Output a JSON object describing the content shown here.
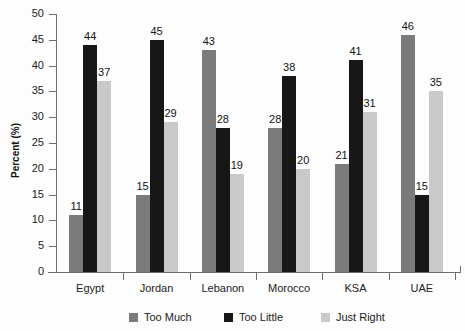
{
  "chart_data": {
    "type": "bar",
    "title": "",
    "xlabel": "",
    "ylabel": "Percent (%)",
    "ylim": [
      0,
      50
    ],
    "ytick_step": 5,
    "yticks": [
      50,
      45,
      40,
      35,
      30,
      25,
      20,
      15,
      10,
      5,
      0
    ],
    "grid": false,
    "legend_position": "bottom",
    "categories": [
      "Egypt",
      "Jordan",
      "Lebanon",
      "Morocco",
      "KSA",
      "UAE"
    ],
    "series": [
      {
        "name": "Too Much",
        "color": "#7b7b7b",
        "values": [
          11,
          15,
          43,
          28,
          21,
          46
        ]
      },
      {
        "name": "Too Little",
        "color": "#171717",
        "values": [
          44,
          45,
          28,
          38,
          41,
          15
        ]
      },
      {
        "name": "Just Right",
        "color": "#c9c9c9",
        "values": [
          37,
          29,
          19,
          20,
          31,
          35
        ]
      }
    ],
    "data_labels_shown": true
  },
  "legend": {
    "items": [
      {
        "label": "Too Much"
      },
      {
        "label": "Too Little"
      },
      {
        "label": "Just Right"
      }
    ]
  }
}
